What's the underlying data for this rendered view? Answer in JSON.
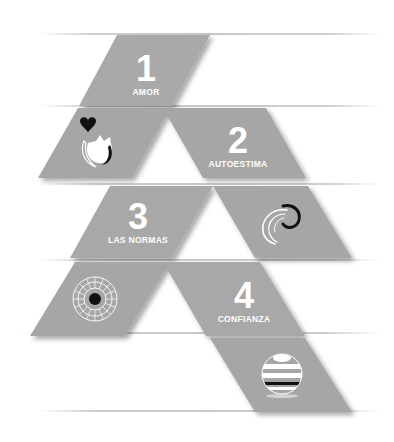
{
  "colors": {
    "tile": "#a8a8a8",
    "tile_shadow": "#8a8a8a",
    "line": "#cccccc",
    "text": "#ffffff",
    "icon_dark": "#111111"
  },
  "steps": [
    {
      "number": "1",
      "label": "AMOR",
      "icon": "heart-dove-icon"
    },
    {
      "number": "2",
      "label": "AUTOESTIMA",
      "icon": "swirl-icon"
    },
    {
      "number": "3",
      "label": "LAS NORMAS",
      "icon": "sunburst-flower-icon"
    },
    {
      "number": "4",
      "label": "CONFIANZA",
      "icon": "striped-sphere-icon"
    }
  ]
}
